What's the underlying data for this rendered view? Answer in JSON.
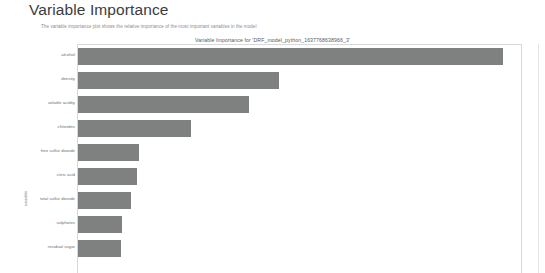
{
  "page": {
    "heading": "Variable Importance",
    "subtitle": "The variable importance plot shows the relative importance of the most important variables in the model"
  },
  "chart_data": {
    "type": "bar",
    "orientation": "horizontal",
    "title": "Variable Importance for 'DRF_model_python_1637768638966_3'",
    "xlabel": "",
    "ylabel": "variable",
    "grid": false,
    "legend": null,
    "bar_color": "#7f8080",
    "xlim": [
      0,
      1
    ],
    "categories": [
      "alcohol",
      "density",
      "volatile acidity",
      "chlorides",
      "free sulfur dioxide",
      "citric acid",
      "total sulfur dioxide",
      "sulphates",
      "residual sugar"
    ],
    "values": [
      1.0,
      0.472,
      0.403,
      0.266,
      0.144,
      0.139,
      0.125,
      0.104,
      0.1
    ]
  },
  "colors": {
    "heading": "#3c3c3c",
    "subtitle": "#8d8d8d",
    "bar": "#7f8080",
    "frame": "#d8d8d8",
    "background": "#ffffff"
  }
}
